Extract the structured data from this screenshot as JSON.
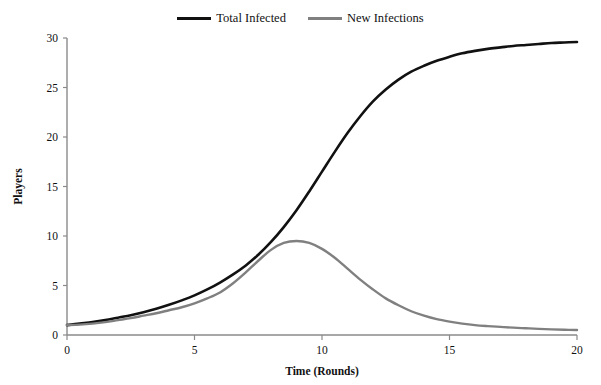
{
  "chart_data": {
    "type": "line",
    "title": "",
    "xlabel": "Time (Rounds)",
    "ylabel": "Players",
    "xlim": [
      0,
      20
    ],
    "ylim": [
      0,
      30
    ],
    "xticks": [
      0,
      5,
      10,
      15,
      20
    ],
    "yticks": [
      0,
      5,
      10,
      15,
      20,
      25,
      30
    ],
    "grid": false,
    "legend_position": "top-center",
    "x": [
      0,
      0.5,
      1,
      1.5,
      2,
      2.5,
      3,
      3.5,
      4,
      4.5,
      5,
      5.5,
      6,
      6.5,
      7,
      7.5,
      8,
      8.5,
      9,
      9.5,
      10,
      10.5,
      11,
      11.5,
      12,
      12.5,
      13,
      13.5,
      14,
      14.5,
      15,
      15.5,
      16,
      16.5,
      17,
      17.5,
      18,
      18.5,
      19,
      19.5,
      20
    ],
    "series": [
      {
        "name": "Total Infected",
        "color": "#111111",
        "values": [
          1.0,
          1.15,
          1.3,
          1.5,
          1.75,
          2.0,
          2.3,
          2.65,
          3.05,
          3.5,
          4.0,
          4.6,
          5.3,
          6.1,
          7.0,
          8.1,
          9.4,
          10.9,
          12.6,
          14.5,
          16.5,
          18.5,
          20.4,
          22.1,
          23.6,
          24.8,
          25.8,
          26.6,
          27.2,
          27.7,
          28.1,
          28.45,
          28.7,
          28.9,
          29.05,
          29.2,
          29.3,
          29.4,
          29.5,
          29.55,
          29.6
        ]
      },
      {
        "name": "New Infections",
        "color": "#808080",
        "values": [
          1.0,
          1.05,
          1.15,
          1.3,
          1.5,
          1.7,
          1.95,
          2.2,
          2.5,
          2.8,
          3.2,
          3.7,
          4.3,
          5.2,
          6.3,
          7.5,
          8.6,
          9.3,
          9.5,
          9.3,
          8.7,
          7.8,
          6.7,
          5.6,
          4.6,
          3.7,
          3.0,
          2.4,
          1.95,
          1.6,
          1.35,
          1.15,
          1.0,
          0.9,
          0.82,
          0.74,
          0.68,
          0.62,
          0.57,
          0.53,
          0.5
        ]
      }
    ]
  },
  "legend": {
    "entries": [
      {
        "label": "Total Infected",
        "color": "#111111"
      },
      {
        "label": "New Infections",
        "color": "#808080"
      }
    ]
  },
  "axes": {
    "x_title": "Time (Rounds)",
    "y_title": "Players",
    "x_tick_labels": [
      "0",
      "5",
      "10",
      "15",
      "20"
    ],
    "y_tick_labels": [
      "0",
      "5",
      "10",
      "15",
      "20",
      "25",
      "30"
    ]
  }
}
